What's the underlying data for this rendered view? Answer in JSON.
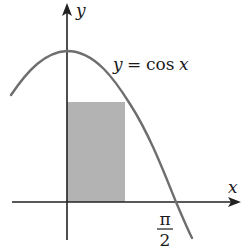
{
  "diagram": {
    "curve_label": "y = cos x",
    "curve_label_y": "y",
    "curve_label_eq": "=",
    "curve_label_func": "cos",
    "curve_label_x": "x",
    "x_axis_label": "x",
    "y_axis_label": "y",
    "tick_label_numerator": "π",
    "tick_label_denominator": "2",
    "tick_label": "π/2",
    "colors": {
      "curve": "#6e6e6e",
      "axes": "#222222",
      "rectangle_fill": "#b3b3b3",
      "background": "#ffffff"
    }
  }
}
